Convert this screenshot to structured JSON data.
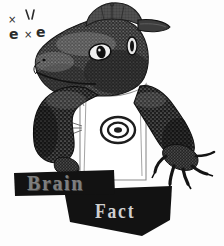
{
  "artwork": {
    "title_line_1": "Brain",
    "title_line_2": "Fact",
    "subject": "lizard-wearing-baseball-cap-and-tshirt",
    "style": "black-and-white-engraving-halftone",
    "background_color": "#fdfdfd"
  },
  "banners": {
    "brain": {
      "label": "Brain",
      "shape": "rectangle",
      "fill_color": "#121212",
      "text_color": "#7e7e7e"
    },
    "fact": {
      "label": "Fact",
      "shape": "down-arrow-chevron",
      "fill_color": "#121212",
      "text_color": "#cfcfcf"
    }
  },
  "figure": {
    "cap": {
      "name": "baseball-cap",
      "color": "#4f4f4f"
    },
    "shirt": {
      "name": "white-t-shirt",
      "color": "#ffffff",
      "graphic": "bullseye-target"
    },
    "arms": {
      "left_label": "left-lizard-arm",
      "right_label": "right-lizard-arm",
      "color": "#1a1a1a"
    },
    "head": {
      "label": "lizard-head-profile",
      "color": "#2a2a2a"
    }
  },
  "doodles": {
    "marks": [
      "×",
      "e",
      "×",
      "e"
    ],
    "description": "scattered-dizzy-marks"
  }
}
